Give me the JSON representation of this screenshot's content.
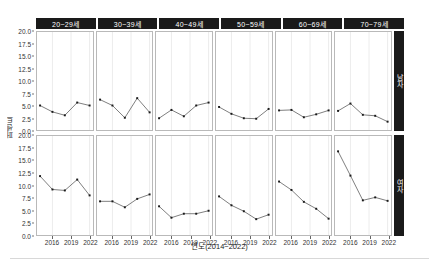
{
  "chart_data": {
    "type": "line",
    "title": "",
    "subtitle": "",
    "xlabel": "연도(2014~2022)",
    "ylabel": "퍼센트",
    "ylim": [
      0,
      20
    ],
    "xlim": [
      2014,
      2022
    ],
    "grid": true,
    "legend_position": "none",
    "yticks": [
      "0.0",
      "2.5",
      "5.0",
      "7.5",
      "10.0",
      "12.5",
      "15.0",
      "17.5",
      "20.0"
    ],
    "ytick_values": [
      0,
      2.5,
      5,
      7.5,
      10,
      12.5,
      15,
      17.5,
      20
    ],
    "xticks": [
      "2016",
      "2019",
      "2022"
    ],
    "xtick_values": [
      2016,
      2019,
      2022
    ],
    "facet_columns": [
      "20~29세",
      "30~39세",
      "40~49세",
      "50~59세",
      "60~69세",
      "70~79세"
    ],
    "facet_rows": [
      "남자",
      "여자"
    ],
    "x": [
      2014,
      2016,
      2018,
      2020,
      2022
    ],
    "marker": "filled-square",
    "line_color": "#5a5a5a",
    "marker_color": "#1a1a1a",
    "panel_border_color": "#b9b9b9",
    "strip_background": "#1a1a1a",
    "strip_text_color": "#ffffff",
    "series": [
      {
        "name": "남자 · 20~29세",
        "row": "남자",
        "column": "20~29세",
        "values": [
          5.0,
          3.7,
          3.0,
          5.6,
          5.0
        ]
      },
      {
        "name": "남자 · 30~39세",
        "row": "남자",
        "column": "30~39세",
        "values": [
          6.2,
          5.0,
          2.5,
          6.5,
          3.6
        ]
      },
      {
        "name": "남자 · 40~49세",
        "row": "남자",
        "column": "40~49세",
        "values": [
          2.4,
          4.1,
          2.8,
          5.0,
          5.6
        ]
      },
      {
        "name": "남자 · 50~59세",
        "row": "남자",
        "column": "50~59세",
        "values": [
          4.7,
          3.3,
          2.4,
          2.3,
          4.3
        ]
      },
      {
        "name": "남자 · 60~69세",
        "row": "남자",
        "column": "60~69세",
        "values": [
          4.0,
          4.1,
          2.6,
          3.2,
          4.0
        ]
      },
      {
        "name": "남자 · 70~79세",
        "row": "남자",
        "column": "70~79세",
        "values": [
          3.9,
          5.4,
          3.1,
          2.9,
          1.7
        ]
      },
      {
        "name": "여자 · 20~29세",
        "row": "여자",
        "column": "20~29세",
        "values": [
          11.9,
          9.2,
          9.0,
          11.2,
          8.0
        ]
      },
      {
        "name": "여자 · 30~39세",
        "row": "여자",
        "column": "30~39세",
        "values": [
          6.8,
          6.8,
          5.6,
          7.3,
          8.2
        ]
      },
      {
        "name": "여자 · 40~49세",
        "row": "여자",
        "column": "40~49세",
        "values": [
          5.8,
          3.5,
          4.3,
          4.3,
          4.9
        ]
      },
      {
        "name": "여자 · 50~59세",
        "row": "여자",
        "column": "50~59세",
        "values": [
          7.8,
          6.0,
          4.8,
          3.2,
          4.1
        ]
      },
      {
        "name": "여자 · 60~69세",
        "row": "여자",
        "column": "60~69세",
        "values": [
          10.8,
          9.1,
          6.7,
          5.3,
          3.3
        ]
      },
      {
        "name": "여자 · 70~79세",
        "row": "여자",
        "column": "70~79세",
        "values": [
          16.9,
          12.0,
          7.0,
          7.6,
          6.9
        ]
      }
    ]
  }
}
